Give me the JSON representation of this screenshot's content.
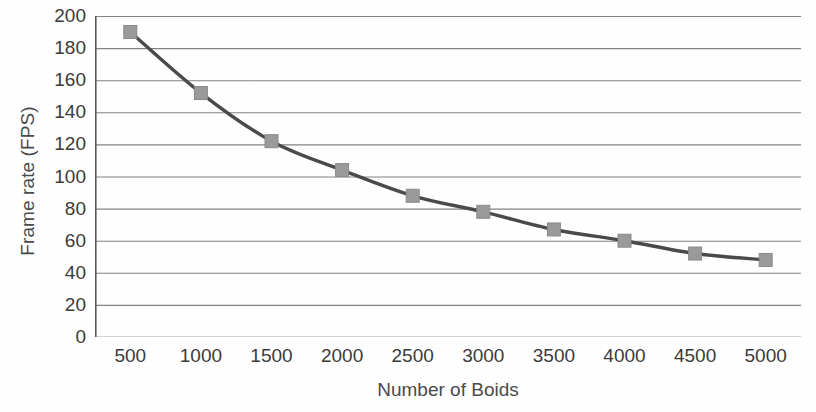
{
  "chart_data": {
    "type": "line",
    "title": "",
    "xlabel": "Number of Boids",
    "ylabel": "Frame rate (FPS)",
    "x": [
      500,
      1000,
      1500,
      2000,
      2500,
      3000,
      3500,
      4000,
      4500,
      5000
    ],
    "xtick_labels": [
      "500",
      "1000",
      "1500",
      "2000",
      "2500",
      "3000",
      "3500",
      "4000",
      "4500",
      "5000"
    ],
    "values": [
      190,
      152,
      122,
      104,
      88,
      78,
      67,
      60,
      52,
      48
    ],
    "series": [
      {
        "name": "Frame rate",
        "values": [
          190,
          152,
          122,
          104,
          88,
          78,
          67,
          60,
          52,
          48
        ]
      }
    ],
    "ylim": [
      0,
      200
    ],
    "ytick_labels": [
      "0",
      "20",
      "40",
      "60",
      "80",
      "100",
      "120",
      "140",
      "160",
      "180",
      "200"
    ],
    "yticks": [
      0,
      20,
      40,
      60,
      80,
      100,
      120,
      140,
      160,
      180,
      200
    ],
    "xlim": [
      500,
      5000
    ],
    "grid": "horizontal",
    "legend": "none",
    "marker": "square",
    "line_color": "#4a4a4a",
    "marker_color": "#9a9a9a",
    "marker_edge_color": "#8a8a8a",
    "gridline_color": "#6e6e6e",
    "axis_color": "#5a5a5a",
    "background_color": "#ffffff"
  }
}
